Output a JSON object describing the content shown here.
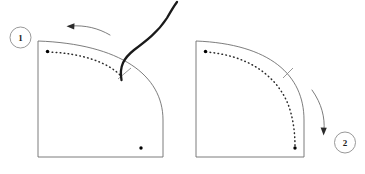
{
  "figure": {
    "type": "instructional-diagram",
    "title": "",
    "background_color": "#ffffff",
    "width": 365,
    "height": 174
  },
  "colors": {
    "outline": "#6e6e6e",
    "label_circle": "#8c8c8c",
    "label_text": "#1a1a1a",
    "stitch_dots": "#2b2b2b",
    "thread": "#1a1a1a",
    "motion_arrow": "#6e6e6e",
    "tick_mark": "#8c8c8c",
    "endpoint_dot": "#000000"
  },
  "panels": [
    {
      "id": "panel-1",
      "label": "1",
      "label_position": "top-left",
      "shape": "quarter-circle-sector",
      "stitch_line": {
        "style": "dotted",
        "coverage": "partial",
        "start_marker": "dot",
        "end_marker": "thread-attachment"
      },
      "thread": {
        "present": true,
        "description": "thread pulled up and to the right"
      },
      "motion_arrow": {
        "present": true,
        "direction": "left",
        "position": "above panel"
      },
      "tick_mark": true,
      "corner_dot": true
    },
    {
      "id": "panel-2",
      "label": "2",
      "label_position": "bottom-right",
      "shape": "quarter-circle-sector",
      "stitch_line": {
        "style": "dotted",
        "coverage": "full",
        "start_marker": "dot",
        "end_marker": "dot"
      },
      "thread": {
        "present": false,
        "description": ""
      },
      "motion_arrow": {
        "present": true,
        "direction": "down",
        "position": "right of panel"
      },
      "tick_mark": true,
      "corner_dot": true
    }
  ]
}
